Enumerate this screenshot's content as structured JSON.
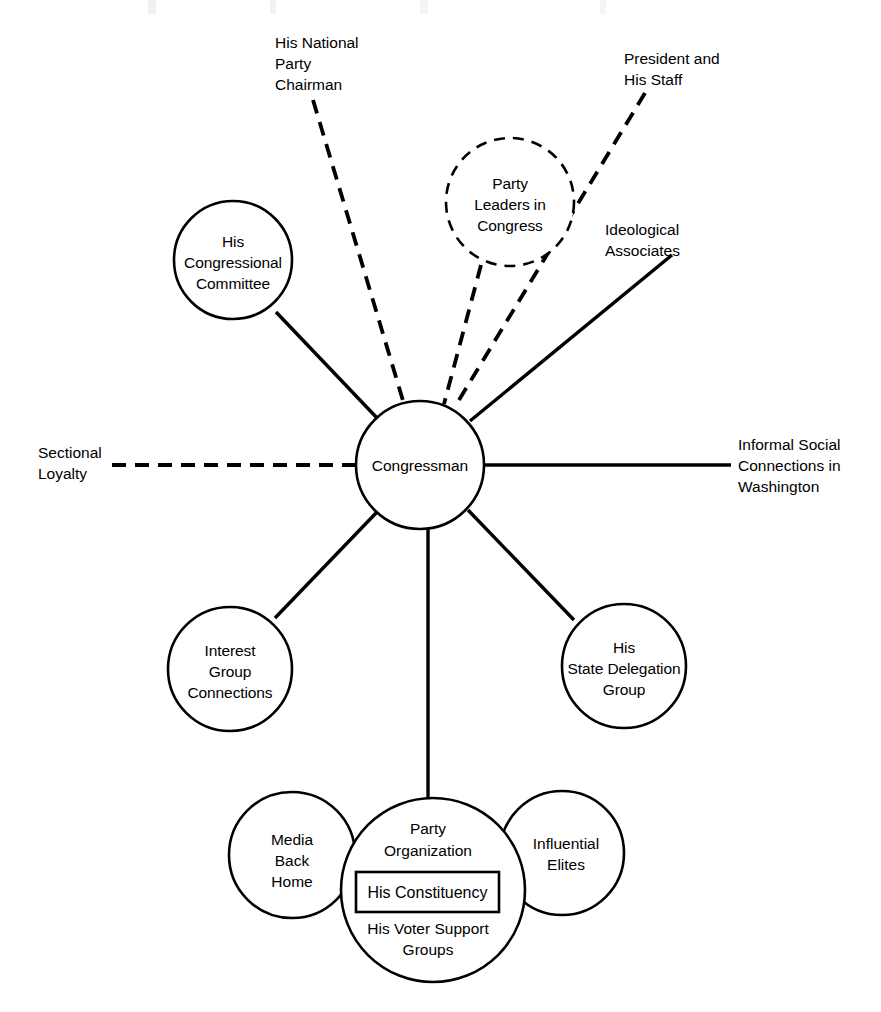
{
  "diagram": {
    "center_node": {
      "id": "congressman",
      "label": "Congressman",
      "shape": "circle",
      "style": "solid"
    },
    "nodes": [
      {
        "id": "his-congressional-committee",
        "lines": [
          "His",
          "Congressional",
          "Committee"
        ],
        "shape": "circle",
        "style": "solid",
        "link_style": "solid"
      },
      {
        "id": "party-leaders-in-congress",
        "lines": [
          "Party",
          "Leaders in",
          "Congress"
        ],
        "shape": "circle",
        "style": "dashed",
        "link_style": "dashed"
      },
      {
        "id": "interest-group-connections",
        "lines": [
          "Interest",
          "Group",
          "Connections"
        ],
        "shape": "circle",
        "style": "solid",
        "link_style": "solid"
      },
      {
        "id": "his-state-delegation-group",
        "lines": [
          "His",
          "State Delegation",
          "Group"
        ],
        "shape": "circle",
        "style": "solid",
        "link_style": "solid"
      }
    ],
    "edge_labels": [
      {
        "id": "his-national-party-chairman",
        "lines": [
          "His National",
          "Party",
          "Chairman"
        ],
        "link_style": "dashed",
        "anchor": "start"
      },
      {
        "id": "president-and-his-staff",
        "lines": [
          "President and",
          "His Staff"
        ],
        "link_style": "dashed",
        "anchor": "start"
      },
      {
        "id": "ideological-associates",
        "lines": [
          "Ideological",
          "Associates"
        ],
        "link_style": "solid",
        "anchor": "start"
      },
      {
        "id": "sectional-loyalty",
        "lines": [
          "Sectional",
          "Loyalty"
        ],
        "link_style": "dashed",
        "anchor": "start"
      },
      {
        "id": "informal-social-connections-in-washington",
        "lines": [
          "Informal Social",
          "Connections in",
          "Washington"
        ],
        "link_style": "solid",
        "anchor": "start"
      }
    ],
    "constituency_cluster": {
      "id": "his-constituency-cluster",
      "link_style": "solid",
      "left_circle": {
        "id": "media-back-home",
        "lines": [
          "Media",
          "Back",
          "Home"
        ],
        "style": "solid"
      },
      "right_circle": {
        "id": "influential-elites",
        "lines": [
          "Influential",
          "Elites"
        ],
        "style": "solid"
      },
      "center_circle": {
        "id": "party-organization",
        "style": "solid",
        "top_lines": [
          "Party",
          "Organization"
        ],
        "boxed_label": "His Constituency",
        "bottom_lines": [
          "His Voter Support",
          "Groups"
        ]
      }
    },
    "colors": {
      "stroke": "#000000",
      "fill": "#ffffff",
      "text": "#000000"
    }
  }
}
